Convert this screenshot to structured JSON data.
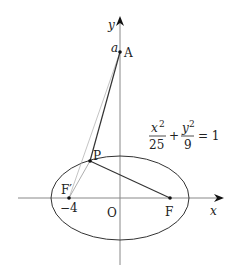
{
  "diagram": {
    "type": "ellipse-focus-geometry",
    "equation": {
      "num1": "x",
      "exp1": "2",
      "den1": "25",
      "plus": "+",
      "num2": "y",
      "exp2": "2",
      "den2": "9",
      "rhs": "= 1"
    },
    "axes": {
      "x_label": "x",
      "y_label": "y",
      "origin_label": "O"
    },
    "points": {
      "A": {
        "label": "A",
        "coord_label": "a"
      },
      "P": {
        "label": "P"
      },
      "F_left": {
        "label": "F′",
        "coord_label": "−4"
      },
      "F_right": {
        "label": "F"
      }
    },
    "colors": {
      "stroke": "#333333",
      "axis": "#888888",
      "faint": "#aaaaaa"
    }
  }
}
